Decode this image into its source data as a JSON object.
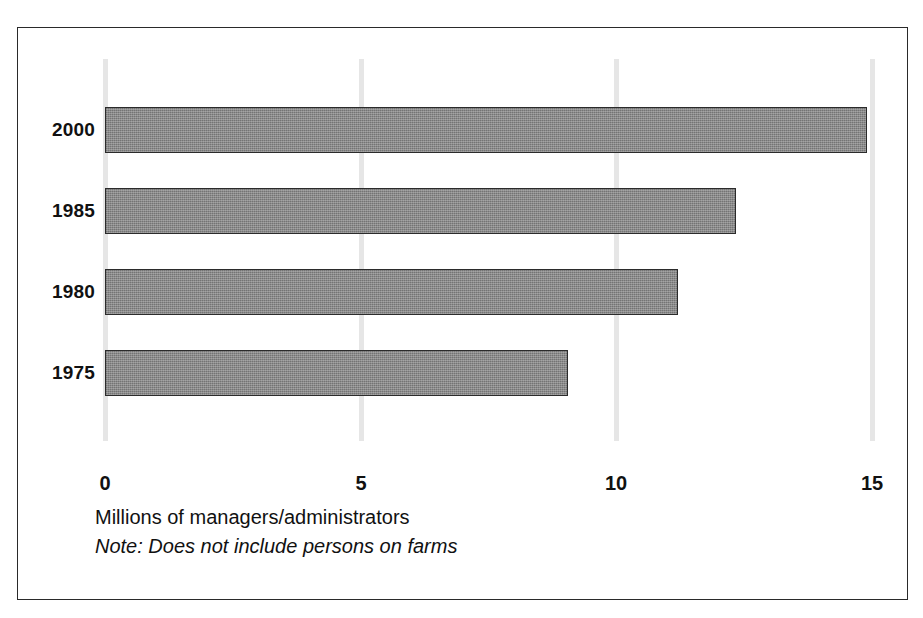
{
  "chart_data": {
    "type": "bar",
    "orientation": "horizontal",
    "title": "",
    "subtitle": "",
    "xlabel": "Millions of managers/administrators",
    "ylabel": "",
    "note": "Note: Does not include persons on farms",
    "categories": [
      "2000",
      "1985",
      "1980",
      "1975"
    ],
    "values": [
      14.9,
      12.35,
      11.2,
      9.05
    ],
    "series": [
      {
        "name": "Millions of managers/administrators",
        "values": [
          14.9,
          12.35,
          11.2,
          9.05
        ]
      }
    ],
    "xlim": [
      0,
      15
    ],
    "xticks": [
      0,
      5,
      10,
      15
    ],
    "xtick_labels": [
      "0",
      "5",
      "10",
      "15"
    ],
    "grid": true,
    "grid_axis": "x",
    "legend": false,
    "legend_position": "none",
    "bar_fill_color": "#8a8a8a",
    "bar_border_color": "#2b2b2b",
    "gridline_color": "#e6e6e6",
    "frame_color": "#2a2a2a",
    "background_color": "#ffffff"
  },
  "figure": {
    "bars": [
      {
        "category": "2000",
        "value": 14.9
      },
      {
        "category": "1985",
        "value": 12.35
      },
      {
        "category": "1980",
        "value": 11.2
      },
      {
        "category": "1975",
        "value": 9.05
      }
    ],
    "axis": {
      "ticks": [
        "0",
        "5",
        "10",
        "15"
      ],
      "title": "Millions of managers/administrators",
      "note": "Note: Does not include persons on farms"
    }
  }
}
